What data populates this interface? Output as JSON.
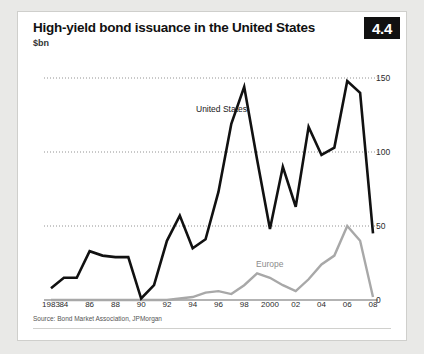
{
  "figure": {
    "number": "4.4",
    "title": "High-yield bond issuance in the United States",
    "subtitle": "$bn",
    "source": "Source: Bond Market Association, JPMorgan"
  },
  "series_labels": {
    "united_states": "United States",
    "europe": "Europe"
  },
  "colors": {
    "united_states": "#111111",
    "europe": "#a8a8a8",
    "gridline": "#777777",
    "badge_bg": "#111111",
    "badge_text": "#ffffff",
    "panel_bg": "#ffffff",
    "page_bg": "#e9e9e7"
  },
  "chart_data": {
    "type": "line",
    "title": "High-yield bond issuance in the United States",
    "subtitle": "$bn",
    "xlabel": "",
    "ylabel": "$bn",
    "ylim": [
      0,
      150
    ],
    "yticks": [
      0,
      50,
      100,
      150
    ],
    "ytick_labels": [
      "0",
      "50",
      "100",
      "150"
    ],
    "grid": "horizontal-dotted",
    "legend": "inline-annotations",
    "x": [
      1983,
      1984,
      1985,
      1986,
      1987,
      1988,
      1989,
      1990,
      1991,
      1992,
      1993,
      1994,
      1995,
      1996,
      1997,
      1998,
      1999,
      2000,
      2001,
      2002,
      2003,
      2004,
      2005,
      2006,
      2007,
      2008
    ],
    "xtick_values": [
      1983,
      1984,
      1986,
      1988,
      1990,
      1992,
      1994,
      1996,
      1998,
      2000,
      2002,
      2004,
      2006,
      2008
    ],
    "xtick_labels": [
      "1983",
      "84",
      "86",
      "88",
      "90",
      "92",
      "94",
      "96",
      "98",
      "2000",
      "02",
      "04",
      "06",
      "08"
    ],
    "series": [
      {
        "name": "United States",
        "color": "#111111",
        "values": [
          8,
          15,
          15,
          33,
          30,
          29,
          29,
          1,
          10,
          40,
          57,
          35,
          41,
          73,
          119,
          144,
          95,
          48,
          90,
          63,
          117,
          98,
          103,
          148,
          140,
          45
        ]
      },
      {
        "name": "Europe",
        "color": "#a8a8a8",
        "values": [
          0,
          0,
          0,
          0,
          0,
          0,
          0,
          0,
          0,
          0,
          1,
          2,
          5,
          6,
          4,
          10,
          18,
          15,
          10,
          6,
          14,
          24,
          30,
          50,
          40,
          2
        ]
      }
    ]
  }
}
